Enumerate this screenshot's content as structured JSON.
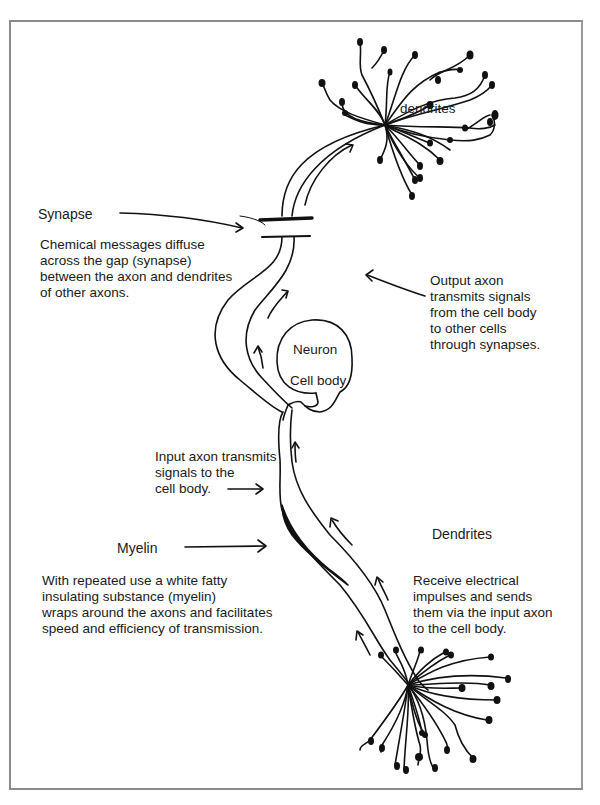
{
  "diagram": {
    "type": "neuron-illustration",
    "style": "hand-drawn black ink on white",
    "colors": {
      "ink": "#111111",
      "frame": "#8a8a8a",
      "background": "#ffffff"
    }
  },
  "labels": {
    "dendrites_top": "dendrites",
    "synapse": {
      "title": "Synapse",
      "lines": [
        "Chemical messages diffuse",
        "across the gap (synapse)",
        "between the axon and dendrites",
        "of other axons."
      ]
    },
    "output_axon": {
      "lines": [
        "Output axon",
        "transmits signals",
        "from the cell body",
        "to other cells",
        "through synapses."
      ]
    },
    "cell_body": {
      "line1": "Neuron",
      "line2": "Cell body"
    },
    "input_axon": {
      "lines": [
        "Input axon transmits",
        "signals to the",
        "cell body."
      ]
    },
    "myelin": {
      "title": "Myelin",
      "lines": [
        "With repeated use a white fatty",
        "insulating substance (myelin)",
        "wraps around the axons and facilitates",
        "speed and efficiency of transmission."
      ]
    },
    "dendrites_bottom": {
      "title": "Dendrites",
      "lines": [
        "Receive electrical",
        "impulses and sends",
        "them via the input axon",
        "to the cell body."
      ]
    }
  }
}
